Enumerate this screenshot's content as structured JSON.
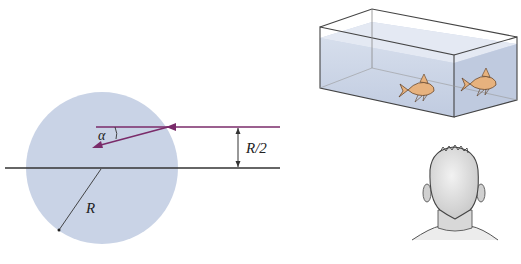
{
  "figure": {
    "left_panel": {
      "description": "Ray incident on a circular cross-section at height R/2 and refracting at angle alpha",
      "labels": {
        "angle": "α",
        "offset": "R/2",
        "radius": "R"
      },
      "colors": {
        "sphere_fill": "#c9d3e6",
        "ray": "#7a2b6a",
        "axis": "#333333"
      }
    },
    "right_panel": {
      "top": {
        "description": "Rectangular fish tank with two goldfish, one seen through front face and one through side face"
      },
      "bottom": {
        "description": "Observer seen from behind (back of head)"
      },
      "colors": {
        "water": "#c3cee3",
        "fish": "#e7b27e",
        "tank_edge": "#444444",
        "head": "#dcdcdc"
      }
    }
  }
}
